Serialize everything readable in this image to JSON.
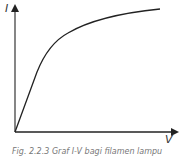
{
  "diagram": {
    "type": "I-V characteristic curve",
    "y_axis_label": "I",
    "x_axis_label": "V",
    "caption": "Fig. 2.2.3 Graf I-V bagi filamen lampu",
    "colors": {
      "axis": "#222222",
      "curve": "#222222",
      "background": "#ffffff"
    }
  }
}
